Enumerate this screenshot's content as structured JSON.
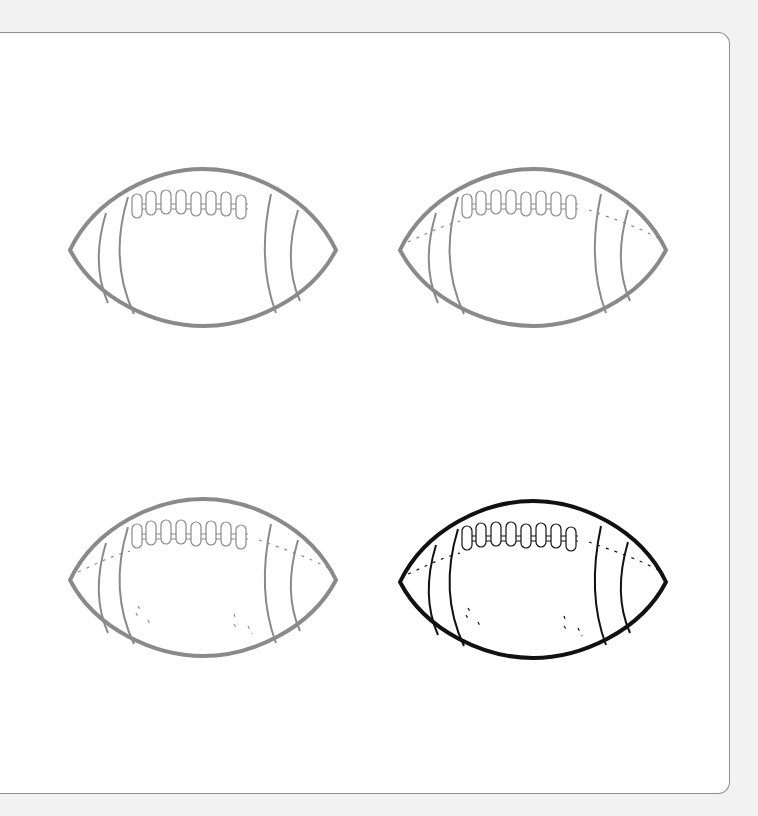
{
  "page": {
    "background": "#f2f2f2",
    "panel_background": "#ffffff",
    "panel_border": "#8c8c8c"
  },
  "steps": [
    {
      "label": "Step 1",
      "stroke": "#8a8a8a",
      "seam": false,
      "highlights": false,
      "x": 66,
      "y": 166
    },
    {
      "label": "Step 2",
      "stroke": "#8a8a8a",
      "seam": true,
      "highlights": false,
      "x": 396,
      "y": 166
    },
    {
      "label": "Step 3",
      "stroke": "#8a8a8a",
      "seam": true,
      "highlights": true,
      "x": 66,
      "y": 496
    },
    {
      "label": "Step 4",
      "stroke": "#111111",
      "seam": true,
      "highlights": true,
      "x": 396,
      "y": 498
    }
  ]
}
